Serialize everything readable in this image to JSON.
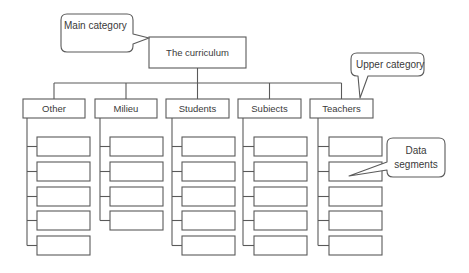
{
  "diagram": {
    "type": "hierarchy",
    "root": {
      "label": "The curriculum",
      "x": 149,
      "y": 37,
      "w": 97,
      "h": 31
    },
    "bus_y": 83,
    "categories": [
      {
        "label": "Other",
        "x": 23,
        "y": 99,
        "w": 62,
        "h": 19,
        "trunk_x": 27,
        "child_x": 37,
        "child_w": 53,
        "children": 5
      },
      {
        "label": "Milieu",
        "x": 95,
        "y": 99,
        "w": 62,
        "h": 19,
        "trunk_x": 100,
        "child_x": 110,
        "child_w": 53,
        "children": 4
      },
      {
        "label": "Students",
        "x": 166,
        "y": 99,
        "w": 63,
        "h": 19,
        "trunk_x": 172,
        "child_x": 182,
        "child_w": 53,
        "children": 5
      },
      {
        "label": "Subiects",
        "x": 238,
        "y": 99,
        "w": 63,
        "h": 19,
        "trunk_x": 243,
        "child_x": 254,
        "child_w": 53,
        "children": 5
      },
      {
        "label": "Teachers",
        "x": 310,
        "y": 99,
        "w": 63,
        "h": 19,
        "trunk_x": 318,
        "child_x": 329,
        "child_w": 53,
        "children": 5
      }
    ],
    "child_rows_y": [
      137,
      162,
      187,
      211,
      236
    ],
    "child_h": 19,
    "callouts": [
      {
        "id": "main-category",
        "lines": [
          "Main category"
        ],
        "x": 61,
        "y": 14,
        "w": 72,
        "h": 38,
        "tip": [
          149,
          38
        ],
        "base": [
          [
            133,
            34
          ],
          [
            133,
            44
          ]
        ]
      },
      {
        "id": "upper-category",
        "lines": [
          "Upper category"
        ],
        "x": 351,
        "y": 53,
        "w": 73,
        "h": 23,
        "tip": [
          360,
          98
        ],
        "base": [
          [
            358,
            76
          ],
          [
            368,
            76
          ]
        ]
      },
      {
        "id": "data-segments",
        "lines": [
          "Data",
          "segments"
        ],
        "x": 387,
        "y": 138,
        "w": 58,
        "h": 39,
        "tip": [
          349,
          176
        ],
        "base": [
          [
            387,
            162
          ],
          [
            387,
            170
          ]
        ]
      }
    ]
  },
  "labels": {
    "root": "The curriculum",
    "categories": [
      "Other",
      "Milieu",
      "Students",
      "Subiects",
      "Teachers"
    ],
    "callouts": {
      "main_category": "Main category",
      "upper_category": "Upper category",
      "data_segments_line1": "Data",
      "data_segments_line2": "segments"
    }
  },
  "colors": {
    "stroke": "#5a5a5a",
    "text": "#3a3a3a",
    "background": "#ffffff"
  }
}
